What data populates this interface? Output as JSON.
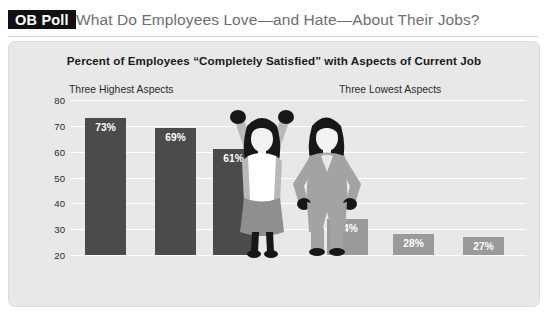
{
  "header": {
    "badge": "OB Poll",
    "headline": "What Do Employees Love—and Hate—About Their Jobs?"
  },
  "panel": {
    "subtitle": "Percent of Employees “Completely Satisfied” with Aspects of Current Job",
    "group_high": "Three Highest Aspects",
    "group_low": "Three Lowest Aspects"
  },
  "figures": {
    "celebrating": "celebrating-woman-illustration",
    "frustrated": "frustrated-woman-illustration"
  },
  "chart_data": {
    "type": "bar",
    "title": "Percent of Employees “Completely Satisfied” with Aspects of Current Job",
    "xlabel": "",
    "ylabel": "",
    "ylim": [
      20,
      80
    ],
    "yticks": [
      80,
      70,
      60,
      50,
      40,
      30,
      20
    ],
    "grid": true,
    "legend": "none",
    "categories": [
      "Workplace physical conditions",
      "Coworkers",
      "Flexibility of work hours",
      "Retirement plan",
      "Pay",
      "On-the-job stress"
    ],
    "category_lines": [
      [
        "Workplace",
        "physical",
        "conditions"
      ],
      [
        "Coworkers"
      ],
      [
        "Flexibility",
        "of work",
        "hours"
      ],
      [
        "Retirement",
        "plan"
      ],
      [
        "Pay"
      ],
      [
        "On-the-job",
        "stress"
      ]
    ],
    "values": [
      73,
      69,
      61,
      34,
      28,
      27
    ],
    "data_labels": [
      "73%",
      "69%",
      "61%",
      "34%",
      "28%",
      "27%"
    ],
    "groups": [
      {
        "name": "Three Highest Aspects",
        "indices": [
          0,
          1,
          2
        ],
        "color": "#4b4b4b"
      },
      {
        "name": "Three Lowest Aspects",
        "indices": [
          3,
          4,
          5
        ],
        "color": "#9a9a9a"
      }
    ],
    "colors": {
      "high_bar": "#4b4b4b",
      "low_bar": "#9a9a9a",
      "panel_bg": "#e8e8e8",
      "gridline": "#ffffff",
      "badge_bg": "#111111",
      "headline": "#6d6e71"
    }
  }
}
